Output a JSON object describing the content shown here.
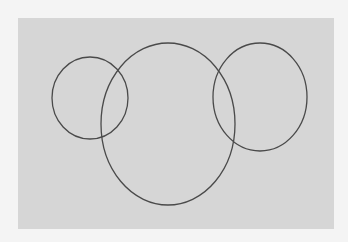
{
  "diagram": {
    "type": "venn-like circles",
    "background_color": "#f4f4f4",
    "panel": {
      "x": 18,
      "y": 18,
      "width": 316,
      "height": 211,
      "color": "#d6d6d6"
    },
    "stroke_color": "#4a4a4a",
    "shapes": [
      {
        "name": "left-circle",
        "cx": 90,
        "cy": 98,
        "rx": 38,
        "ry": 41
      },
      {
        "name": "middle-ellipse",
        "cx": 168,
        "cy": 124,
        "rx": 67,
        "ry": 81
      },
      {
        "name": "right-circle",
        "cx": 260,
        "cy": 97,
        "rx": 47,
        "ry": 54
      }
    ]
  }
}
